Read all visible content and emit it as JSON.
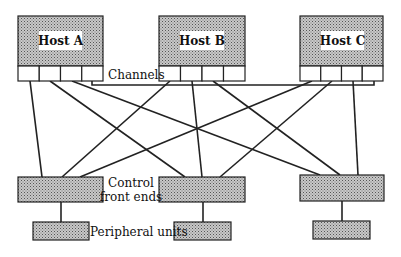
{
  "diagram": {
    "type": "system-architecture",
    "colors": {
      "stroke": "#222222",
      "fill_pattern": "#9a9a9a",
      "background": "#ffffff",
      "label_bg": "#ffffff"
    },
    "hosts": [
      {
        "id": "host-a",
        "label": "Host A",
        "x": 18,
        "y": 16,
        "w": 85,
        "h": 50,
        "channels": 4
      },
      {
        "id": "host-b",
        "label": "Host B",
        "x": 159,
        "y": 16,
        "w": 86,
        "h": 50,
        "channels": 4
      },
      {
        "id": "host-c",
        "label": "Host C",
        "x": 300,
        "y": 16,
        "w": 83,
        "h": 50,
        "channels": 4
      }
    ],
    "channels_label": "Channels",
    "control_label_line1": "Control",
    "control_label_line2": "front ends",
    "peripheral_label": "Peripheral units",
    "control_units": [
      {
        "id": "cfe-1",
        "x": 18,
        "y": 177,
        "w": 85,
        "h": 25
      },
      {
        "id": "cfe-2",
        "x": 159,
        "y": 177,
        "w": 86,
        "h": 25
      },
      {
        "id": "cfe-3",
        "x": 300,
        "y": 175,
        "w": 84,
        "h": 26
      }
    ],
    "peripheral_units": [
      {
        "id": "pu-1",
        "x": 33,
        "y": 222,
        "w": 56,
        "h": 18
      },
      {
        "id": "pu-2",
        "x": 174,
        "y": 222,
        "w": 57,
        "h": 18
      },
      {
        "id": "pu-3",
        "x": 313,
        "y": 221,
        "w": 57,
        "h": 18
      }
    ],
    "edges": [
      [
        "host-a.ch1",
        "cfe-1"
      ],
      [
        "host-a.ch2",
        "cfe-2"
      ],
      [
        "host-a.ch3",
        "cfe-3"
      ],
      [
        "host-b.ch1",
        "cfe-1"
      ],
      [
        "host-b.ch2",
        "cfe-2"
      ],
      [
        "host-b.ch3",
        "cfe-3"
      ],
      [
        "host-c.ch1",
        "cfe-1"
      ],
      [
        "host-c.ch2",
        "cfe-2"
      ],
      [
        "host-c.ch3",
        "cfe-3"
      ],
      [
        "cfe-1",
        "pu-1"
      ],
      [
        "cfe-2",
        "pu-2"
      ],
      [
        "cfe-3",
        "pu-3"
      ]
    ]
  }
}
